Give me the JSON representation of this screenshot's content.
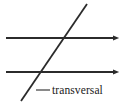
{
  "figure": {
    "type": "geometry-diagram",
    "background_color": "#ffffff",
    "stroke_color": "#2b2b2b",
    "text_color": "#1a1a1a",
    "canvas": {
      "width": 127,
      "height": 105
    },
    "label": {
      "text": "transversal",
      "x": 52,
      "y": 94,
      "font_size": 11.5,
      "font_style": "serif"
    },
    "leader_line": {
      "x1": 36,
      "y1": 90,
      "x2": 50,
      "y2": 90,
      "stroke_width": 1.1
    },
    "parallel_lines": [
      {
        "name": "upper-parallel-line",
        "x1": 6,
        "y1": 38,
        "x2": 113,
        "y2": 38,
        "stroke_width": 1.8,
        "arrow_end": true,
        "arrow_tip_x": 121
      },
      {
        "name": "lower-parallel-line",
        "x1": 6,
        "y1": 72,
        "x2": 113,
        "y2": 72,
        "stroke_width": 1.8,
        "arrow_end": true,
        "arrow_tip_x": 121
      }
    ],
    "transversal_line": {
      "name": "transversal-line",
      "x1": 87,
      "y1": 4,
      "x2": 21,
      "y2": 101,
      "stroke_width": 1.8,
      "arrow_end": false
    },
    "intersections": [
      {
        "name": "upper-intersection",
        "x": 69,
        "y": 38
      },
      {
        "name": "lower-intersection",
        "x": 43,
        "y": 72
      }
    ]
  }
}
